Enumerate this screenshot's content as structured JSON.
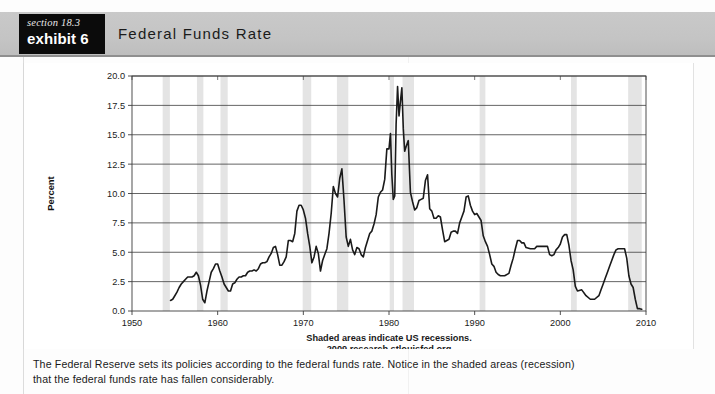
{
  "header": {
    "section_label": "section 18.3",
    "exhibit_label": "exhibit 6",
    "title": "Federal Funds Rate"
  },
  "footer": {
    "line1": "The Federal Reserve sets its policies according to the federal funds rate. Notice in the shaded areas (recession)",
    "line2": "that the federal funds rate has fallen considerably."
  },
  "chart_data": {
    "type": "line",
    "title": "Federal Funds Rate",
    "xlabel": "",
    "ylabel": "Percent",
    "xlim": [
      1950,
      2010
    ],
    "ylim": [
      0.0,
      20.0
    ],
    "grid": true,
    "legend": "none",
    "xticks": [
      1950,
      1960,
      1970,
      1980,
      1990,
      2000,
      2010
    ],
    "xtick_labels": [
      "1950",
      "1960",
      "1970",
      "1980",
      "1990",
      "2000",
      "2010"
    ],
    "yticks": [
      0.0,
      2.5,
      5.0,
      7.5,
      10.0,
      12.5,
      15.0,
      17.5,
      20.0
    ],
    "ytick_labels": [
      "0.0",
      "2.5",
      "5.0",
      "7.5",
      "10.0",
      "12.5",
      "15.0",
      "17.5",
      "20.0"
    ],
    "line_color": "#1a1a1a",
    "recession_band_color": "#e4e4e4",
    "annotations": [
      "Shaded areas indicate US recessions.",
      "2009 research.stlouisfed.org"
    ],
    "recessions": [
      [
        1953.58,
        1954.42
      ],
      [
        1957.58,
        1958.33
      ],
      [
        1960.33,
        1961.17
      ],
      [
        1969.92,
        1970.92
      ],
      [
        1973.92,
        1975.25
      ],
      [
        1980.08,
        1980.58
      ],
      [
        1981.58,
        1982.92
      ],
      [
        1990.58,
        1991.25
      ],
      [
        2001.25,
        2001.92
      ],
      [
        2007.92,
        2009.5
      ]
    ],
    "series": [
      {
        "name": "Federal Funds Rate",
        "x": [
          1954.5,
          1954.75,
          1955.0,
          1955.25,
          1955.5,
          1955.75,
          1956.0,
          1956.25,
          1956.5,
          1956.75,
          1957.0,
          1957.25,
          1957.5,
          1957.75,
          1958.0,
          1958.25,
          1958.5,
          1958.75,
          1959.0,
          1959.25,
          1959.5,
          1959.75,
          1960.0,
          1960.25,
          1960.5,
          1960.75,
          1961.0,
          1961.25,
          1961.5,
          1961.75,
          1962.0,
          1962.25,
          1962.5,
          1962.75,
          1963.0,
          1963.25,
          1963.5,
          1963.75,
          1964.0,
          1964.25,
          1964.5,
          1964.75,
          1965.0,
          1965.25,
          1965.5,
          1965.75,
          1966.0,
          1966.25,
          1966.5,
          1966.75,
          1967.0,
          1967.25,
          1967.5,
          1967.75,
          1968.0,
          1968.25,
          1968.5,
          1968.75,
          1969.0,
          1969.25,
          1969.5,
          1969.75,
          1970.0,
          1970.25,
          1970.5,
          1970.75,
          1971.0,
          1971.25,
          1971.5,
          1971.75,
          1972.0,
          1972.25,
          1972.5,
          1972.75,
          1973.0,
          1973.25,
          1973.5,
          1973.75,
          1974.0,
          1974.25,
          1974.5,
          1974.75,
          1975.0,
          1975.25,
          1975.5,
          1975.75,
          1976.0,
          1976.25,
          1976.5,
          1976.75,
          1977.0,
          1977.25,
          1977.5,
          1977.75,
          1978.0,
          1978.25,
          1978.5,
          1978.75,
          1979.0,
          1979.25,
          1979.5,
          1979.75,
          1980.0,
          1980.17,
          1980.33,
          1980.5,
          1980.67,
          1980.83,
          1981.0,
          1981.17,
          1981.33,
          1981.5,
          1981.67,
          1981.83,
          1982.0,
          1982.25,
          1982.5,
          1982.75,
          1983.0,
          1983.25,
          1983.5,
          1983.75,
          1984.0,
          1984.25,
          1984.5,
          1984.75,
          1985.0,
          1985.25,
          1985.5,
          1985.75,
          1986.0,
          1986.25,
          1986.5,
          1986.75,
          1987.0,
          1987.25,
          1987.5,
          1987.75,
          1988.0,
          1988.25,
          1988.5,
          1988.75,
          1989.0,
          1989.25,
          1989.5,
          1989.75,
          1990.0,
          1990.25,
          1990.5,
          1990.75,
          1991.0,
          1991.25,
          1991.5,
          1991.75,
          1992.0,
          1992.25,
          1992.5,
          1992.75,
          1993.0,
          1993.5,
          1994.0,
          1994.25,
          1994.5,
          1994.75,
          1995.0,
          1995.25,
          1995.5,
          1995.75,
          1996.0,
          1996.5,
          1997.0,
          1997.25,
          1997.5,
          1998.0,
          1998.5,
          1998.75,
          1999.0,
          1999.25,
          1999.5,
          1999.75,
          2000.0,
          2000.25,
          2000.5,
          2000.75,
          2001.0,
          2001.25,
          2001.5,
          2001.75,
          2002.0,
          2002.5,
          2003.0,
          2003.5,
          2004.0,
          2004.5,
          2004.75,
          2005.0,
          2005.25,
          2005.5,
          2005.75,
          2006.0,
          2006.25,
          2006.5,
          2006.75,
          2007.0,
          2007.5,
          2007.75,
          2008.0,
          2008.25,
          2008.5,
          2008.75,
          2009.0,
          2009.25,
          2009.5
        ],
        "y": [
          0.9,
          1.0,
          1.3,
          1.6,
          2.0,
          2.3,
          2.5,
          2.7,
          2.9,
          2.9,
          2.9,
          3.0,
          3.3,
          3.0,
          2.2,
          1.0,
          0.7,
          1.7,
          2.5,
          3.3,
          3.6,
          4.0,
          4.0,
          3.4,
          2.9,
          2.3,
          2.0,
          1.7,
          1.7,
          2.3,
          2.4,
          2.7,
          2.9,
          2.9,
          3.0,
          3.0,
          3.3,
          3.4,
          3.4,
          3.5,
          3.4,
          3.6,
          4.0,
          4.1,
          4.1,
          4.2,
          4.6,
          4.9,
          5.4,
          5.5,
          4.8,
          3.9,
          3.9,
          4.2,
          4.6,
          6.0,
          6.0,
          5.9,
          6.6,
          8.5,
          9.0,
          9.0,
          8.6,
          7.9,
          6.6,
          5.5,
          4.1,
          4.6,
          5.5,
          4.9,
          3.4,
          4.3,
          4.8,
          5.3,
          6.6,
          8.3,
          10.6,
          10.0,
          9.7,
          11.3,
          12.1,
          9.4,
          6.3,
          5.5,
          6.1,
          5.2,
          4.8,
          5.4,
          5.3,
          4.8,
          4.6,
          5.4,
          6.0,
          6.6,
          6.8,
          7.4,
          8.2,
          9.7,
          10.1,
          10.3,
          11.2,
          13.8,
          13.8,
          15.1,
          11.6,
          9.5,
          9.8,
          15.9,
          19.1,
          16.6,
          17.8,
          19.0,
          15.5,
          13.6,
          14.0,
          14.5,
          10.1,
          9.3,
          8.6,
          8.8,
          9.4,
          9.5,
          9.6,
          11.1,
          11.6,
          8.7,
          8.5,
          7.9,
          7.9,
          8.1,
          8.0,
          6.9,
          5.9,
          6.0,
          6.1,
          6.7,
          6.8,
          6.8,
          6.6,
          7.5,
          8.0,
          8.5,
          9.7,
          9.8,
          9.0,
          8.5,
          8.2,
          8.3,
          8.0,
          7.7,
          6.4,
          5.9,
          5.5,
          4.8,
          4.0,
          3.8,
          3.3,
          3.1,
          3.0,
          3.0,
          3.2,
          3.9,
          4.5,
          5.3,
          6.0,
          6.0,
          5.8,
          5.8,
          5.4,
          5.3,
          5.3,
          5.5,
          5.5,
          5.5,
          5.5,
          4.8,
          4.7,
          4.8,
          5.2,
          5.4,
          5.7,
          6.3,
          6.5,
          6.5,
          5.6,
          4.3,
          3.5,
          2.1,
          1.7,
          1.8,
          1.3,
          1.0,
          1.0,
          1.3,
          1.8,
          2.3,
          2.8,
          3.3,
          3.8,
          4.3,
          4.8,
          5.2,
          5.3,
          5.3,
          5.3,
          4.5,
          3.0,
          2.3,
          2.0,
          1.0,
          0.2,
          0.2,
          0.15
        ]
      }
    ]
  }
}
